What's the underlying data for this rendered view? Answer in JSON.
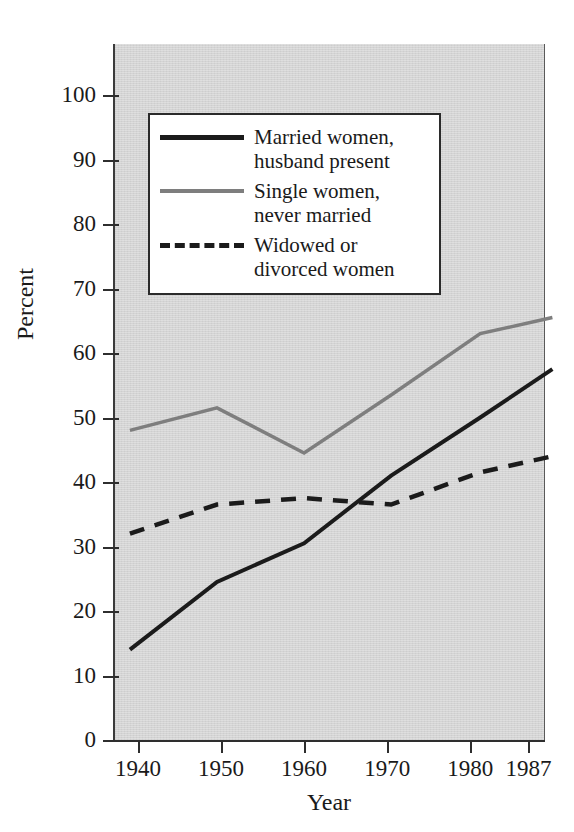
{
  "title_remnant": "Labor Force Participation",
  "axes": {
    "ylabel": "Percent",
    "xlabel": "Year",
    "yticks": [
      "0",
      "10",
      "20",
      "30",
      "40",
      "50",
      "60",
      "70",
      "80",
      "90",
      "100"
    ],
    "xticks": [
      "1940",
      "1950",
      "1960",
      "1970",
      "1980",
      "1987"
    ]
  },
  "legend": {
    "items": [
      {
        "label": "Married women,\nhusband present",
        "style": "solid-black",
        "color": "#1b1b1b"
      },
      {
        "label": "Single women,\nnever married",
        "style": "solid-gray",
        "color": "#7e7e7e"
      },
      {
        "label": "Widowed or\ndivorced women",
        "style": "dashed-black",
        "color": "#1b1b1b"
      }
    ]
  },
  "chart_data": {
    "type": "line",
    "title": "Labor Force Participation",
    "xlabel": "Year",
    "ylabel": "Percent",
    "categories": [
      "1940",
      "1950",
      "1960",
      "1970",
      "1980",
      "1987"
    ],
    "x": [
      1940,
      1950,
      1960,
      1970,
      1980,
      1987
    ],
    "ylim": [
      0,
      100
    ],
    "xlim": [
      1937,
      1989
    ],
    "ytick_step": 10,
    "grid": false,
    "legend_position": "upper-left-inside",
    "series": [
      {
        "name": "Married women, husband present",
        "color": "#1b1b1b",
        "linestyle": "solid",
        "linewidth": 4,
        "values": [
          14,
          24.5,
          30.5,
          41,
          50,
          57.5
        ]
      },
      {
        "name": "Single women, never married",
        "color": "#7e7e7e",
        "linestyle": "solid",
        "linewidth": 3.5,
        "values": [
          48,
          51.5,
          44.5,
          53.5,
          63,
          65.5
        ]
      },
      {
        "name": "Widowed or divorced women",
        "color": "#1b1b1b",
        "linestyle": "dashed",
        "linewidth": 4.5,
        "values": [
          32,
          36.5,
          37.5,
          36.5,
          41.5,
          44
        ]
      }
    ]
  }
}
